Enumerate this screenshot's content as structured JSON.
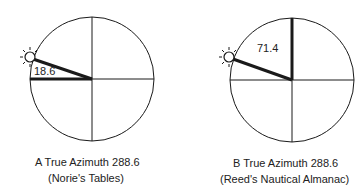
{
  "diagrams": [
    {
      "id": "A",
      "angle_label": "18.6",
      "caption_line1": "A  True Azimuth 288.6",
      "caption_line2": "(Norie's Tables)",
      "reference": "west",
      "angle_deg": 18.6
    },
    {
      "id": "B",
      "angle_label": "71.4",
      "caption_line1": "B  True Azimuth 288.6",
      "caption_line2": "(Reed's Nautical Almanac)",
      "reference": "north",
      "angle_deg": 71.4
    }
  ],
  "icons": {
    "sun": "sun-icon"
  },
  "colors": {
    "line": "#1a1a1a",
    "background": "#ffffff"
  }
}
